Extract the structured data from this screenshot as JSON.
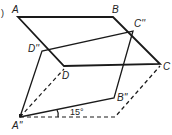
{
  "figure": {
    "part_marker": ")",
    "labels": {
      "A": "A",
      "B": "B",
      "C": "C",
      "D": "D",
      "A2": "A''",
      "B2": "B''",
      "C2": "C''",
      "D2": "D''"
    },
    "angle_label": "15°"
  }
}
